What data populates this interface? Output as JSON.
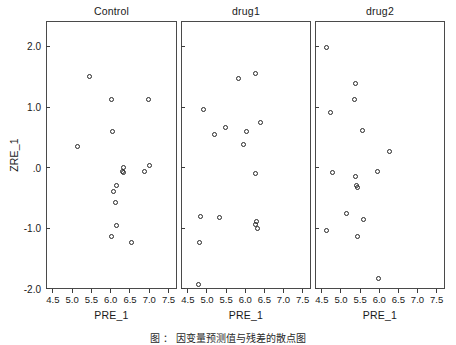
{
  "figure": {
    "y_axis_title": "ZRE_1",
    "x_axis_title": "PRE_1",
    "caption": "图 ：  因变量预测值与残差的散点图"
  },
  "axes": {
    "x_ticks": [
      "4.5",
      "5.0",
      "5.5",
      "6.0",
      "6.5",
      "7.0",
      "7.5"
    ],
    "x_tick_values": [
      4.5,
      5.0,
      5.5,
      6.0,
      6.5,
      7.0,
      7.5
    ],
    "y_ticks": [
      "2.0",
      "1.0",
      ".0",
      "-1.0",
      "-2.0"
    ],
    "y_tick_values": [
      2.0,
      1.0,
      0.0,
      -1.0,
      -2.0
    ],
    "xlim": [
      4.32,
      7.72
    ],
    "ylim": [
      -2.0,
      2.42
    ]
  },
  "chart_data": {
    "type": "scatter",
    "title": "",
    "xlabel": "PRE_1",
    "ylabel": "ZRE_1",
    "xlim": [
      4.32,
      7.72
    ],
    "ylim": [
      -2.0,
      2.42
    ],
    "xticks": [
      4.5,
      5.0,
      5.5,
      6.0,
      6.5,
      7.0,
      7.5
    ],
    "yticks": [
      2.0,
      1.0,
      0.0,
      -1.0,
      -2.0
    ],
    "grid": false,
    "legend": "none",
    "marker": "open-circle",
    "panel_layout": "1x3 horizontal facets",
    "panels": [
      {
        "label": "Control",
        "n": 16,
        "points": [
          {
            "x": 5.45,
            "y": 1.5
          },
          {
            "x": 6.02,
            "y": 1.13
          },
          {
            "x": 6.98,
            "y": 1.13
          },
          {
            "x": 6.05,
            "y": 0.6
          },
          {
            "x": 5.14,
            "y": 0.35
          },
          {
            "x": 6.32,
            "y": 0.01
          },
          {
            "x": 7.0,
            "y": 0.03
          },
          {
            "x": 6.32,
            "y": -0.08
          },
          {
            "x": 6.88,
            "y": -0.07
          },
          {
            "x": 6.16,
            "y": -0.3
          },
          {
            "x": 6.08,
            "y": -0.4
          },
          {
            "x": 6.12,
            "y": -0.57
          },
          {
            "x": 6.16,
            "y": -0.95
          },
          {
            "x": 6.02,
            "y": -1.14
          },
          {
            "x": 6.55,
            "y": -1.23
          },
          {
            "x": 6.3,
            "y": -0.06
          }
        ]
      },
      {
        "label": "drug1",
        "n": 16,
        "points": [
          {
            "x": 6.27,
            "y": 1.55
          },
          {
            "x": 5.82,
            "y": 1.47
          },
          {
            "x": 4.92,
            "y": 0.96
          },
          {
            "x": 6.4,
            "y": 0.75
          },
          {
            "x": 5.48,
            "y": 0.67
          },
          {
            "x": 6.03,
            "y": 0.6
          },
          {
            "x": 5.2,
            "y": 0.54
          },
          {
            "x": 5.95,
            "y": 0.39
          },
          {
            "x": 6.27,
            "y": -0.09
          },
          {
            "x": 4.82,
            "y": -0.81
          },
          {
            "x": 5.33,
            "y": -0.82
          },
          {
            "x": 6.3,
            "y": -0.89
          },
          {
            "x": 6.33,
            "y": -1.0
          },
          {
            "x": 4.8,
            "y": -1.24
          },
          {
            "x": 4.78,
            "y": -1.92
          },
          {
            "x": 6.28,
            "y": -0.93
          }
        ]
      },
      {
        "label": "drug2",
        "n": 16,
        "points": [
          {
            "x": 4.62,
            "y": 1.99
          },
          {
            "x": 5.38,
            "y": 1.39
          },
          {
            "x": 5.36,
            "y": 1.12
          },
          {
            "x": 4.72,
            "y": 0.91
          },
          {
            "x": 5.56,
            "y": 0.62
          },
          {
            "x": 6.28,
            "y": 0.27
          },
          {
            "x": 4.78,
            "y": -0.08
          },
          {
            "x": 5.95,
            "y": -0.06
          },
          {
            "x": 5.38,
            "y": -0.14
          },
          {
            "x": 5.43,
            "y": -0.32
          },
          {
            "x": 5.15,
            "y": -0.76
          },
          {
            "x": 5.58,
            "y": -0.85
          },
          {
            "x": 4.62,
            "y": -1.04
          },
          {
            "x": 5.42,
            "y": -1.13
          },
          {
            "x": 5.98,
            "y": -1.82
          },
          {
            "x": 5.4,
            "y": -0.3
          }
        ]
      }
    ]
  },
  "geometry": {
    "panels": [
      {
        "left": 46,
        "right": 177
      },
      {
        "left": 181,
        "right": 311
      },
      {
        "left": 315,
        "right": 445
      }
    ],
    "top": 21,
    "bottom": 289,
    "title_y": 5,
    "xlabel_y": 294,
    "axis_title_x_y": 309,
    "axis_title_y_x": 14,
    "caption_y": 330
  },
  "colors": {
    "panel_border": "#4a4a4a",
    "marker_stroke": "#262626",
    "text": "#1a1a1a",
    "background": "#ffffff"
  }
}
